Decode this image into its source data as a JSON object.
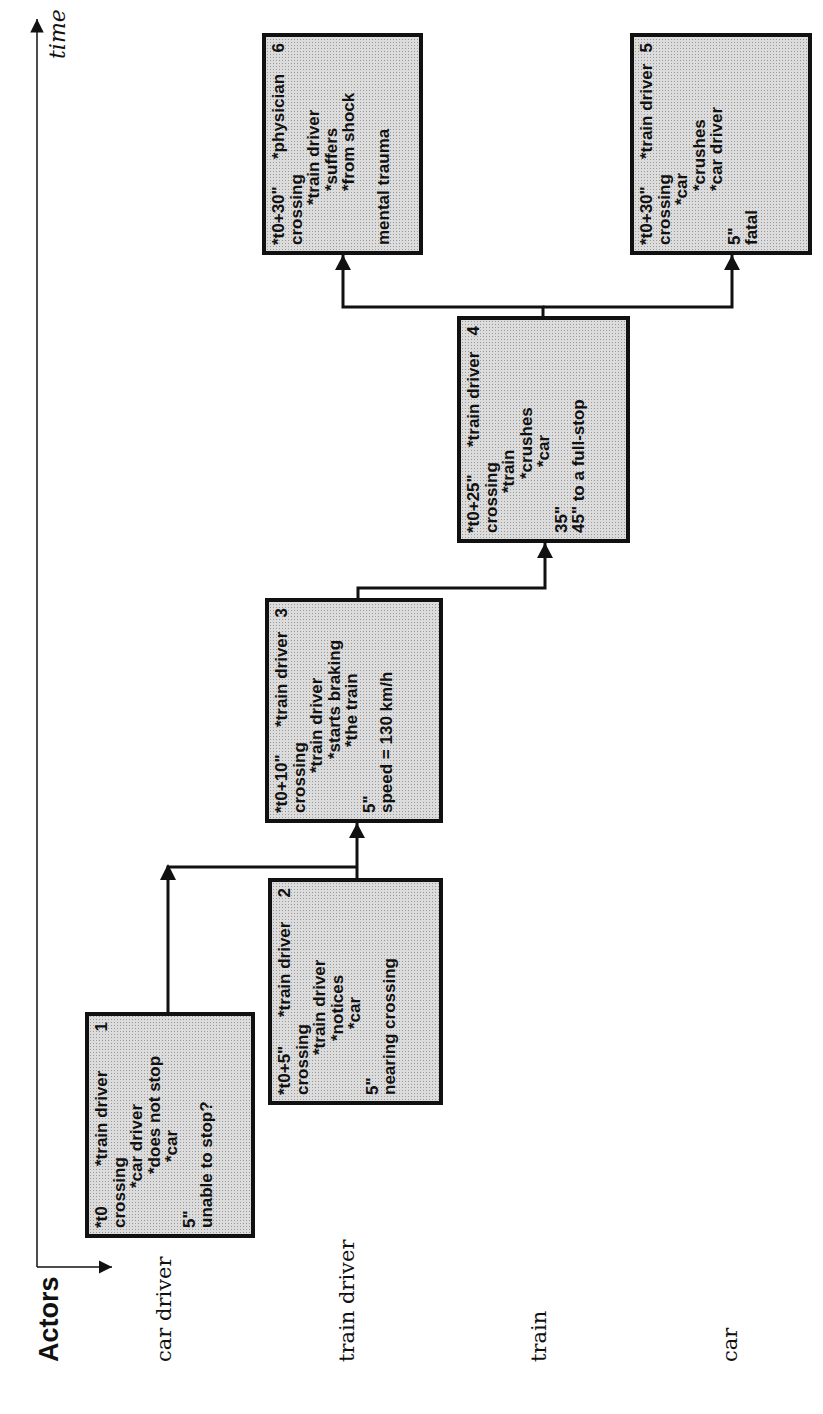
{
  "axes": {
    "time_label": "time",
    "actors_title": "Actors"
  },
  "actors": [
    {
      "label": "car driver"
    },
    {
      "label": "train driver"
    },
    {
      "label": "train"
    },
    {
      "label": "car"
    }
  ],
  "events": [
    {
      "number": "1",
      "time": "*t0",
      "reporter": "*train driver",
      "location": "crossing",
      "subject": "*car driver",
      "action": "*does not stop",
      "object": "*car",
      "duration": "5\"",
      "note": "unable to stop?"
    },
    {
      "number": "2",
      "time": "*t0+5\"",
      "reporter": "*train driver",
      "location": "crossing",
      "subject": "*train driver",
      "action": "*notices",
      "object": "*car",
      "duration": "5\"",
      "note": "nearing crossing"
    },
    {
      "number": "3",
      "time": "*t0+10\"",
      "reporter": "*train driver",
      "location": "crossing",
      "subject": "*train driver",
      "action": "*starts braking",
      "object": "*the train",
      "duration": "5\"",
      "note": "speed = 130 km/h"
    },
    {
      "number": "4",
      "time": "*t0+25\"",
      "reporter": "*train driver",
      "location": "crossing",
      "subject": "*train",
      "action": "*crushes",
      "object": "*car",
      "duration": "35\"",
      "note": "45\" to a full-stop"
    },
    {
      "number": "5",
      "time": "*t0+30\"",
      "reporter": "*train driver",
      "location": "crossing",
      "subject": "*car",
      "action": "*crushes",
      "object": "*car driver",
      "duration": "5\"",
      "note": "fatal"
    },
    {
      "number": "6",
      "time": "*t0+30\"",
      "reporter": "*physician",
      "location": "crossing",
      "subject": "*train driver",
      "action": "*suffers",
      "object": "*from shock",
      "duration": "",
      "note": "mental trauma"
    }
  ],
  "colors": {
    "box_fill": "#dcdcdc",
    "box_border": "#111111",
    "line": "#111111"
  }
}
